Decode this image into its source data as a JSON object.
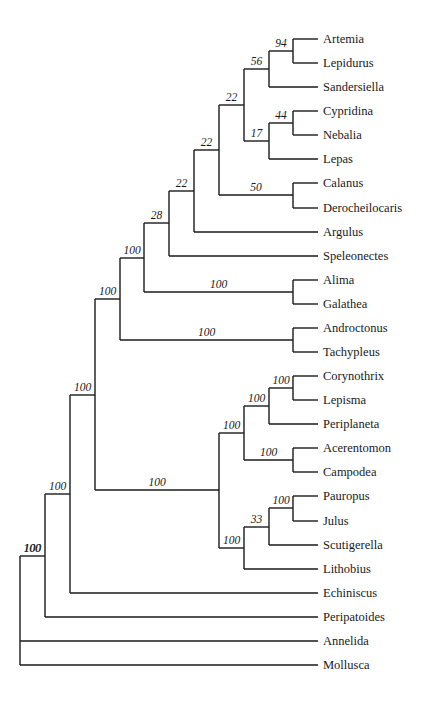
{
  "tip_x": 318,
  "label_x": 323,
  "taxa": [
    {
      "name": "Artemia",
      "y": 39
    },
    {
      "name": "Lepidurus",
      "y": 63
    },
    {
      "name": "Sandersiella",
      "y": 87
    },
    {
      "name": "Cypridina",
      "y": 111
    },
    {
      "name": "Nebalia",
      "y": 135
    },
    {
      "name": "Lepas",
      "y": 159
    },
    {
      "name": "Calanus",
      "y": 183
    },
    {
      "name": "Derocheilocaris",
      "y": 208
    },
    {
      "name": "Argulus",
      "y": 232
    },
    {
      "name": "Speleonectes",
      "y": 256
    },
    {
      "name": "Alima",
      "y": 280
    },
    {
      "name": "Galathea",
      "y": 304
    },
    {
      "name": "Androctonus",
      "y": 328
    },
    {
      "name": "Tachypleus",
      "y": 352
    },
    {
      "name": "Corynothrix",
      "y": 376
    },
    {
      "name": "Lepisma",
      "y": 400
    },
    {
      "name": "Periplaneta",
      "y": 424
    },
    {
      "name": "Acerentomon",
      "y": 448
    },
    {
      "name": "Campodea",
      "y": 472
    },
    {
      "name": "Pauropus",
      "y": 496
    },
    {
      "name": "Julus",
      "y": 521
    },
    {
      "name": "Scutigerella",
      "y": 545
    },
    {
      "name": "Lithobius",
      "y": 569
    },
    {
      "name": "Echiniscus",
      "y": 593
    },
    {
      "name": "Peripatoides",
      "y": 617
    },
    {
      "name": "Annelida",
      "y": 641
    },
    {
      "name": "Mollusca",
      "y": 665
    }
  ],
  "nodes": [
    {
      "id": "n_art_lep",
      "x": 293,
      "y": 51,
      "support": "94",
      "children": [
        "t:0",
        "t:1"
      ]
    },
    {
      "id": "n56",
      "x": 269,
      "y": 69,
      "support": "56",
      "children": [
        "n:n_art_lep",
        "t:2"
      ]
    },
    {
      "id": "n_cyp_neb",
      "x": 293,
      "y": 123,
      "support": "44",
      "children": [
        "t:3",
        "t:4"
      ]
    },
    {
      "id": "n17",
      "x": 269,
      "y": 141,
      "support": "17",
      "children": [
        "n:n_cyp_neb",
        "t:5"
      ]
    },
    {
      "id": "n22a",
      "x": 244,
      "y": 105,
      "support": "22",
      "children": [
        "n:n56",
        "n:n17"
      ]
    },
    {
      "id": "n_cal",
      "x": 293,
      "y": 195,
      "support": "50",
      "children": [
        "t:6",
        "t:7"
      ]
    },
    {
      "id": "n22b",
      "x": 219,
      "y": 150,
      "support": "22",
      "children": [
        "n:n22a",
        "n:n_cal"
      ]
    },
    {
      "id": "n22c",
      "x": 194,
      "y": 191,
      "support": "22",
      "children": [
        "n:n22b",
        "t:8"
      ]
    },
    {
      "id": "n28",
      "x": 169,
      "y": 223,
      "support": "28",
      "children": [
        "n:n22c",
        "t:9"
      ]
    },
    {
      "id": "n_ali",
      "x": 293,
      "y": 292,
      "support": "100",
      "children": [
        "t:10",
        "t:11"
      ]
    },
    {
      "id": "n100a",
      "x": 144,
      "y": 258,
      "support": "100",
      "children": [
        "n:n28",
        "n:n_ali"
      ]
    },
    {
      "id": "n_and",
      "x": 293,
      "y": 340,
      "support": "100",
      "children": [
        "t:12",
        "t:13"
      ]
    },
    {
      "id": "n100b",
      "x": 120,
      "y": 299,
      "support": "100",
      "children": [
        "n:n100a",
        "n:n_and"
      ]
    },
    {
      "id": "n_cor",
      "x": 293,
      "y": 388,
      "support": "100",
      "children": [
        "t:14",
        "t:15"
      ]
    },
    {
      "id": "n_per",
      "x": 269,
      "y": 406,
      "support": "100",
      "children": [
        "n:n_cor",
        "t:16"
      ]
    },
    {
      "id": "n_ace",
      "x": 293,
      "y": 460,
      "support": "100",
      "children": [
        "t:17",
        "t:18"
      ]
    },
    {
      "id": "n_hex",
      "x": 244,
      "y": 433,
      "support": "100",
      "children": [
        "n:n_per",
        "n:n_ace"
      ]
    },
    {
      "id": "n_pau",
      "x": 293,
      "y": 508,
      "support": "100",
      "children": [
        "t:19",
        "t:20"
      ]
    },
    {
      "id": "n33",
      "x": 269,
      "y": 527,
      "support": "33",
      "children": [
        "n:n_pau",
        "t:21"
      ]
    },
    {
      "id": "n_myr",
      "x": 244,
      "y": 548,
      "support": "100",
      "children": [
        "n:n33",
        "t:22"
      ]
    },
    {
      "id": "n_atel",
      "x": 219,
      "y": 490,
      "support": "100",
      "children": [
        "n:n_hex",
        "n:n_myr"
      ]
    },
    {
      "id": "n_arth",
      "x": 95,
      "y": 395,
      "support": "100",
      "children": [
        "n:n100b",
        "n:n_atel"
      ]
    },
    {
      "id": "n_echi",
      "x": 70,
      "y": 494,
      "support": "100",
      "children": [
        "n:n_arth",
        "t:23"
      ]
    },
    {
      "id": "n_peri",
      "x": 45,
      "y": 556,
      "support": "100",
      "children": [
        "n:n_echi",
        "t:24"
      ]
    },
    {
      "id": "root",
      "x": 20,
      "y": 556,
      "support": "100",
      "children": [
        "n:n_peri",
        "t:25",
        "t:26"
      ]
    }
  ]
}
